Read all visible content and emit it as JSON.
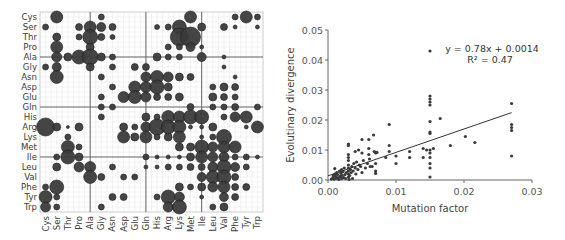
{
  "chart_data": [
    {
      "type": "bubble-matrix",
      "title": "",
      "row_labels": [
        "Cys",
        "Ser",
        "Thr",
        "Pro",
        "Ala",
        "Gly",
        "Asn",
        "Asp",
        "Glu",
        "Gln",
        "His",
        "Arg",
        "Lys",
        "Met",
        "Ile",
        "Leu",
        "Val",
        "Phe",
        "Tyr",
        "Trp"
      ],
      "col_labels": [
        "Cys",
        "Ser",
        "Thr",
        "Pro",
        "Ala",
        "Gly",
        "Asn",
        "Asp",
        "Glu",
        "Gln",
        "His",
        "Arg",
        "Lys",
        "Met",
        "Ile",
        "Leu",
        "Val",
        "Phe",
        "Tyr",
        "Trp"
      ],
      "group_dividers_after_index": [
        3,
        8,
        13
      ],
      "bubble_color": "#3b3b3b",
      "grid": true,
      "cells": [
        [
          0,
          1,
          6
        ],
        [
          0,
          5,
          3
        ],
        [
          0,
          13,
          6
        ],
        [
          0,
          17,
          3
        ],
        [
          0,
          18,
          6
        ],
        [
          0,
          19,
          3
        ],
        [
          1,
          0,
          3
        ],
        [
          1,
          3,
          3.5
        ],
        [
          1,
          4,
          6
        ],
        [
          1,
          5,
          4.5
        ],
        [
          1,
          6,
          3.5
        ],
        [
          1,
          10,
          2.5
        ],
        [
          1,
          11,
          3
        ],
        [
          1,
          12,
          7
        ],
        [
          1,
          14,
          4
        ],
        [
          1,
          16,
          3.5
        ],
        [
          1,
          17,
          2
        ],
        [
          1,
          19,
          2
        ],
        [
          2,
          1,
          4
        ],
        [
          2,
          3,
          3
        ],
        [
          2,
          4,
          7.5
        ],
        [
          2,
          5,
          3.5
        ],
        [
          2,
          6,
          2.5
        ],
        [
          2,
          12,
          9
        ],
        [
          2,
          13,
          10
        ],
        [
          3,
          1,
          6
        ],
        [
          3,
          4,
          4
        ],
        [
          3,
          11,
          3
        ],
        [
          3,
          12,
          3
        ],
        [
          3,
          13,
          4.5
        ],
        [
          3,
          14,
          2
        ],
        [
          4,
          1,
          5
        ],
        [
          4,
          2,
          4
        ],
        [
          4,
          3,
          7
        ],
        [
          4,
          4,
          8
        ],
        [
          4,
          5,
          4
        ],
        [
          4,
          6,
          3
        ],
        [
          4,
          10,
          4
        ],
        [
          4,
          11,
          3
        ],
        [
          4,
          12,
          3
        ],
        [
          4,
          14,
          4.5
        ],
        [
          4,
          16,
          2
        ],
        [
          5,
          0,
          3
        ],
        [
          5,
          1,
          4.5
        ],
        [
          5,
          4,
          4
        ],
        [
          5,
          6,
          3
        ],
        [
          5,
          8,
          3.5
        ],
        [
          5,
          9,
          3.5
        ],
        [
          5,
          16,
          2
        ],
        [
          6,
          1,
          6.5
        ],
        [
          6,
          5,
          3
        ],
        [
          6,
          9,
          5
        ],
        [
          6,
          10,
          6.5
        ],
        [
          6,
          11,
          5
        ],
        [
          6,
          12,
          4
        ],
        [
          6,
          13,
          3.5
        ],
        [
          6,
          17,
          2
        ],
        [
          7,
          6,
          3
        ],
        [
          7,
          8,
          6
        ],
        [
          7,
          9,
          5.5
        ],
        [
          7,
          10,
          7
        ],
        [
          7,
          11,
          4
        ],
        [
          7,
          15,
          3
        ],
        [
          7,
          16,
          4
        ],
        [
          7,
          17,
          3.5
        ],
        [
          8,
          5,
          3
        ],
        [
          8,
          7,
          5.5
        ],
        [
          8,
          8,
          6.5
        ],
        [
          8,
          9,
          5
        ],
        [
          8,
          10,
          3.5
        ],
        [
          8,
          11,
          3.5
        ],
        [
          8,
          12,
          4
        ],
        [
          8,
          15,
          4
        ],
        [
          8,
          16,
          3.5
        ],
        [
          8,
          17,
          3
        ],
        [
          9,
          5,
          3
        ],
        [
          9,
          6,
          3
        ],
        [
          9,
          13,
          3.5
        ],
        [
          9,
          15,
          3
        ],
        [
          9,
          16,
          3
        ],
        [
          9,
          17,
          3.5
        ],
        [
          9,
          19,
          3
        ],
        [
          10,
          5,
          3
        ],
        [
          10,
          9,
          4
        ],
        [
          10,
          10,
          3
        ],
        [
          10,
          11,
          6.5
        ],
        [
          10,
          12,
          6
        ],
        [
          10,
          13,
          7
        ],
        [
          10,
          14,
          7
        ],
        [
          10,
          16,
          3
        ],
        [
          10,
          17,
          5
        ],
        [
          10,
          18,
          6
        ],
        [
          11,
          0,
          9
        ],
        [
          11,
          1,
          4
        ],
        [
          11,
          2,
          1.5
        ],
        [
          11,
          3,
          4
        ],
        [
          11,
          7,
          4
        ],
        [
          11,
          8,
          3
        ],
        [
          11,
          9,
          5
        ],
        [
          11,
          10,
          8
        ],
        [
          11,
          11,
          7
        ],
        [
          11,
          12,
          6.5
        ],
        [
          11,
          13,
          2
        ],
        [
          11,
          14,
          2
        ],
        [
          11,
          15,
          4
        ],
        [
          11,
          18,
          2
        ],
        [
          11,
          19,
          6
        ],
        [
          12,
          2,
          3
        ],
        [
          12,
          7,
          6
        ],
        [
          12,
          8,
          4
        ],
        [
          12,
          9,
          6
        ],
        [
          12,
          10,
          3
        ],
        [
          12,
          11,
          4
        ],
        [
          12,
          12,
          6
        ],
        [
          12,
          14,
          2
        ],
        [
          12,
          15,
          3
        ],
        [
          12,
          16,
          7.5
        ],
        [
          13,
          2,
          6.5
        ],
        [
          13,
          3,
          3
        ],
        [
          13,
          12,
          4
        ],
        [
          13,
          13,
          4
        ],
        [
          13,
          14,
          7
        ],
        [
          13,
          15,
          5
        ],
        [
          13,
          16,
          6
        ],
        [
          13,
          17,
          6
        ],
        [
          14,
          1,
          3
        ],
        [
          14,
          2,
          7
        ],
        [
          14,
          3,
          4
        ],
        [
          14,
          9,
          3
        ],
        [
          14,
          10,
          2
        ],
        [
          14,
          11,
          2
        ],
        [
          14,
          12,
          2
        ],
        [
          14,
          13,
          4
        ],
        [
          14,
          14,
          6
        ],
        [
          14,
          15,
          5
        ],
        [
          14,
          16,
          5
        ],
        [
          14,
          17,
          3
        ],
        [
          14,
          18,
          3
        ],
        [
          14,
          19,
          2
        ],
        [
          15,
          1,
          4
        ],
        [
          15,
          3,
          5
        ],
        [
          15,
          4,
          5.5
        ],
        [
          15,
          6,
          3
        ],
        [
          15,
          9,
          2
        ],
        [
          15,
          10,
          2
        ],
        [
          15,
          11,
          3
        ],
        [
          15,
          12,
          3
        ],
        [
          15,
          13,
          3.5
        ],
        [
          15,
          14,
          3.5
        ],
        [
          15,
          15,
          5
        ],
        [
          15,
          16,
          7
        ],
        [
          15,
          17,
          4.5
        ],
        [
          15,
          18,
          3
        ],
        [
          16,
          4,
          6.5
        ],
        [
          16,
          5,
          3.5
        ],
        [
          16,
          7,
          3
        ],
        [
          16,
          8,
          3
        ],
        [
          16,
          14,
          4.5
        ],
        [
          16,
          15,
          6.5
        ],
        [
          16,
          16,
          7
        ],
        [
          16,
          17,
          3.5
        ],
        [
          17,
          0,
          3
        ],
        [
          17,
          1,
          7
        ],
        [
          17,
          12,
          4
        ],
        [
          17,
          13,
          3
        ],
        [
          17,
          14,
          4
        ],
        [
          17,
          15,
          5
        ],
        [
          17,
          16,
          6
        ],
        [
          17,
          17,
          3.5
        ],
        [
          17,
          18,
          3.5
        ],
        [
          18,
          0,
          6.5
        ],
        [
          18,
          1,
          3
        ],
        [
          18,
          6,
          3.5
        ],
        [
          18,
          7,
          3.5
        ],
        [
          18,
          10,
          3
        ],
        [
          18,
          11,
          7
        ],
        [
          18,
          12,
          5
        ],
        [
          18,
          14,
          2
        ],
        [
          18,
          16,
          4.5
        ],
        [
          18,
          17,
          3.5
        ],
        [
          19,
          0,
          5
        ],
        [
          19,
          1,
          3
        ],
        [
          19,
          5,
          3
        ],
        [
          19,
          11,
          5
        ],
        [
          19,
          12,
          7
        ],
        [
          19,
          15,
          3
        ],
        [
          19,
          16,
          4
        ]
      ]
    },
    {
      "type": "scatter",
      "title": "",
      "xlabel": "Mutation factor",
      "ylabel": "Evolutinary divergence",
      "xlim": [
        0,
        0.03
      ],
      "ylim": [
        0,
        0.05
      ],
      "xticks": [
        "0.00",
        "0.01",
        "0.02",
        "0.03"
      ],
      "yticks": [
        "0.00",
        "0.01",
        "0.02",
        "0.03",
        "0.04",
        "0.05"
      ],
      "grid": false,
      "point_color": "#3b3b3b",
      "trendline": {
        "slope": 0.78,
        "intercept": 0.0014,
        "x_range": [
          0,
          0.027
        ]
      },
      "annotation": {
        "equation": "y = 0.78x + 0.0014",
        "r2": "R² = 0.47"
      },
      "points": [
        [
          0.0005,
          0.0003
        ],
        [
          0.0007,
          0.0008
        ],
        [
          0.0008,
          0.0015
        ],
        [
          0.0009,
          0.0003
        ],
        [
          0.001,
          0.002
        ],
        [
          0.001,
          0.0038
        ],
        [
          0.0011,
          0.0012
        ],
        [
          0.0012,
          0.0005
        ],
        [
          0.0013,
          0.0025
        ],
        [
          0.0014,
          0.0018
        ],
        [
          0.0015,
          0.0008
        ],
        [
          0.0016,
          0.0002
        ],
        [
          0.0017,
          0.003
        ],
        [
          0.0018,
          0.0012
        ],
        [
          0.0019,
          0.0022
        ],
        [
          0.002,
          0.0005
        ],
        [
          0.002,
          0.0035
        ],
        [
          0.0021,
          0.0015
        ],
        [
          0.0022,
          0.0028
        ],
        [
          0.0023,
          0.0008
        ],
        [
          0.0024,
          0.004
        ],
        [
          0.0025,
          0.0018
        ],
        [
          0.0026,
          0.0005
        ],
        [
          0.0027,
          0.0025
        ],
        [
          0.003,
          0.001
        ],
        [
          0.003,
          0.002
        ],
        [
          0.003,
          0.003
        ],
        [
          0.003,
          0.004
        ],
        [
          0.003,
          0.005
        ],
        [
          0.003,
          0.0065
        ],
        [
          0.003,
          0.0075
        ],
        [
          0.003,
          0.0085
        ],
        [
          0.003,
          0.0115
        ],
        [
          0.003,
          0.012
        ],
        [
          0.0031,
          0.0002
        ],
        [
          0.0032,
          0.0015
        ],
        [
          0.0033,
          0.0035
        ],
        [
          0.0034,
          0.0025
        ],
        [
          0.0035,
          0.0045
        ],
        [
          0.0036,
          0.0005
        ],
        [
          0.0037,
          0.003
        ],
        [
          0.0038,
          0.0055
        ],
        [
          0.004,
          0.0095
        ],
        [
          0.004,
          0.004
        ],
        [
          0.0041,
          0.002
        ],
        [
          0.0042,
          0.006
        ],
        [
          0.0044,
          0.0035
        ],
        [
          0.0045,
          0.01
        ],
        [
          0.0046,
          0.005
        ],
        [
          0.0048,
          0.0045
        ],
        [
          0.005,
          0.009
        ],
        [
          0.005,
          0.0135
        ],
        [
          0.005,
          0.0025
        ],
        [
          0.0052,
          0.0065
        ],
        [
          0.0055,
          0.004
        ],
        [
          0.0058,
          0.0055
        ],
        [
          0.006,
          0.0135
        ],
        [
          0.006,
          0.0105
        ],
        [
          0.006,
          0.0085
        ],
        [
          0.0061,
          0.007
        ],
        [
          0.0062,
          0.0045
        ],
        [
          0.0065,
          0.0045
        ],
        [
          0.0067,
          0.015
        ],
        [
          0.0068,
          0.0095
        ],
        [
          0.007,
          0.009
        ],
        [
          0.007,
          0.0055
        ],
        [
          0.007,
          0.003
        ],
        [
          0.007,
          0.0022
        ],
        [
          0.0072,
          0.0092
        ],
        [
          0.0085,
          0.0075
        ],
        [
          0.009,
          0.0185
        ],
        [
          0.009,
          0.0115
        ],
        [
          0.009,
          0.0095
        ],
        [
          0.01,
          0.008
        ],
        [
          0.01,
          0.0055
        ],
        [
          0.012,
          0.0095
        ],
        [
          0.012,
          0.0075
        ],
        [
          0.014,
          0.0075
        ],
        [
          0.014,
          0.0105
        ],
        [
          0.0145,
          0.01
        ],
        [
          0.015,
          0.043
        ],
        [
          0.015,
          0.028
        ],
        [
          0.015,
          0.027
        ],
        [
          0.015,
          0.026
        ],
        [
          0.015,
          0.025
        ],
        [
          0.015,
          0.0195
        ],
        [
          0.015,
          0.016
        ],
        [
          0.015,
          0.0155
        ],
        [
          0.015,
          0.01
        ],
        [
          0.015,
          0.009
        ],
        [
          0.015,
          0.0075
        ],
        [
          0.015,
          0.0055
        ],
        [
          0.015,
          0.004
        ],
        [
          0.015,
          0.001
        ],
        [
          0.0155,
          0.0105
        ],
        [
          0.0165,
          0.0205
        ],
        [
          0.018,
          0.0115
        ],
        [
          0.0202,
          0.0145
        ],
        [
          0.0216,
          0.0125
        ],
        [
          0.027,
          0.0255
        ],
        [
          0.027,
          0.0185
        ],
        [
          0.027,
          0.0175
        ],
        [
          0.027,
          0.0165
        ],
        [
          0.027,
          0.008
        ]
      ]
    }
  ]
}
